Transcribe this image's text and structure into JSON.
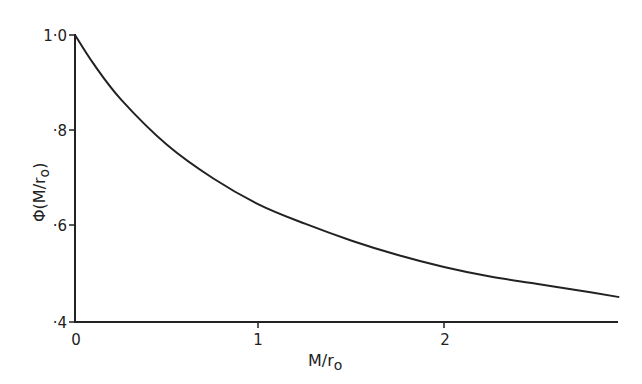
{
  "chart_data": {
    "type": "line",
    "title": "",
    "xlabel": "M/r0",
    "ylabel": "Φ(M/r0)",
    "xlim": [
      0,
      2.95
    ],
    "ylim": [
      0.4,
      1.0
    ],
    "x_ticks": [
      "0",
      "1",
      "2"
    ],
    "y_ticks": [
      "·4",
      "·6",
      "·8",
      "1·0"
    ],
    "grid": false,
    "legend": null,
    "series": [
      {
        "name": "Φ(M/r0)",
        "x": [
          0,
          0.1,
          0.25,
          0.5,
          0.75,
          1.0,
          1.25,
          1.5,
          1.75,
          2.0,
          2.25,
          2.5,
          2.75,
          2.95
        ],
        "y": [
          1.0,
          0.94,
          0.865,
          0.77,
          0.7,
          0.645,
          0.605,
          0.57,
          0.54,
          0.515,
          0.495,
          0.48,
          0.465,
          0.452
        ]
      }
    ]
  },
  "labels": {
    "x_axis_title_main": "M/r",
    "x_axis_title_sub": "o",
    "y_axis_title": "Φ(M/r",
    "y_axis_title_sub": "o",
    "y_axis_title_close": ")",
    "xt0": "0",
    "xt1": "1",
    "xt2": "2",
    "yt4": "·4",
    "yt6": "·6",
    "yt8": "·8",
    "yt10": "1·0"
  }
}
